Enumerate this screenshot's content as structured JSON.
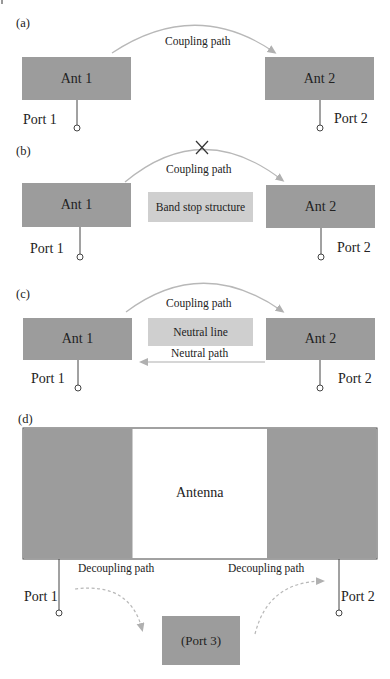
{
  "figure": {
    "panels": [
      {
        "id": "a",
        "label": "(a)",
        "ant1": "Ant 1",
        "ant2": "Ant 2",
        "coupling_label": "Coupling path",
        "port1": "Port 1",
        "port2": "Port 2"
      },
      {
        "id": "b",
        "label": "(b)",
        "ant1": "Ant 1",
        "ant2": "Ant 2",
        "coupling_label": "Coupling path",
        "blocked_mark": "×",
        "middle_structure": "Band stop structure",
        "port1": "Port 1",
        "port2": "Port 2"
      },
      {
        "id": "c",
        "label": "(c)",
        "ant1": "Ant 1",
        "ant2": "Ant 2",
        "coupling_label": "Coupling path",
        "middle_structure": "Neutral line",
        "neutral_path_label": "Neutral path",
        "port1": "Port 1",
        "port2": "Port 2"
      },
      {
        "id": "d",
        "label": "(d)",
        "antenna_label": "Antenna",
        "decoupling_left": "Decoupling path",
        "decoupling_right": "Decoupling path",
        "port1": "Port 1",
        "port2": "Port 2",
        "port3": "(Port 3)"
      }
    ],
    "colors": {
      "antenna_fill": "#9c9c9c",
      "structure_fill": "#cfcfcf",
      "arrow": "#b4b4b4",
      "line": "#444444"
    }
  }
}
